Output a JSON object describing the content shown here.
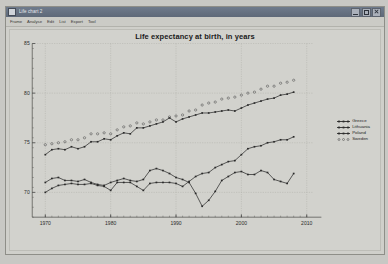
{
  "window": {
    "title": "Life chart 2",
    "icon": "app-icon",
    "buttons": [
      {
        "name": "minimize",
        "label": "_"
      },
      {
        "name": "maximize",
        "label": "□"
      },
      {
        "name": "close",
        "label": "×"
      }
    ]
  },
  "menubar": {
    "items": [
      "Frame",
      "Analyse",
      "Edit",
      "List",
      "Export",
      "Tool"
    ]
  },
  "legend": {
    "entries": [
      {
        "label": "Greece",
        "color": "#2a2a2a",
        "style": "line-marker"
      },
      {
        "label": "Lithuania",
        "color": "#2a2a2a",
        "style": "line-marker"
      },
      {
        "label": "Poland",
        "color": "#2a2a2a",
        "style": "line-marker"
      },
      {
        "label": "Sweden",
        "color": "#555555",
        "style": "dotted-marker"
      }
    ]
  },
  "chart_data": {
    "type": "line",
    "title": "Life expectancy at birth, in years",
    "xlabel": "",
    "ylabel": "",
    "xlim": [
      1968,
      2011
    ],
    "ylim": [
      67.5,
      85
    ],
    "xticks": [
      1970,
      1980,
      1990,
      2000,
      2010
    ],
    "yticks": [
      70,
      75,
      80,
      85
    ],
    "grid": true,
    "legend_position": "right",
    "x": [
      1970,
      1971,
      1972,
      1973,
      1974,
      1975,
      1976,
      1977,
      1978,
      1979,
      1980,
      1981,
      1982,
      1983,
      1984,
      1985,
      1986,
      1987,
      1988,
      1989,
      1990,
      1991,
      1992,
      1993,
      1994,
      1995,
      1996,
      1997,
      1998,
      1999,
      2000,
      2001,
      2002,
      2003,
      2004,
      2005,
      2006,
      2007,
      2008
    ],
    "series": [
      {
        "name": "Greece",
        "color": "#2a2a2a",
        "marker": "filled-square",
        "linestyle": "solid",
        "values": [
          73.8,
          74.3,
          74.4,
          74.3,
          74.6,
          74.4,
          74.6,
          75.1,
          75.1,
          75.4,
          75.3,
          75.7,
          76.0,
          75.9,
          76.5,
          76.5,
          76.7,
          76.9,
          77.1,
          77.5,
          77.1,
          77.4,
          77.6,
          77.8,
          78.0,
          78.0,
          78.1,
          78.2,
          78.3,
          78.2,
          78.5,
          78.8,
          79.0,
          79.2,
          79.4,
          79.5,
          79.8,
          79.9,
          80.1
        ]
      },
      {
        "name": "Sweden",
        "color": "#555555",
        "marker": "open-dot",
        "linestyle": "dotted",
        "values": [
          74.8,
          74.9,
          75.0,
          75.1,
          75.3,
          75.3,
          75.5,
          75.9,
          75.9,
          76.0,
          75.9,
          76.3,
          76.6,
          76.7,
          77.0,
          76.9,
          77.1,
          77.3,
          77.3,
          77.6,
          77.7,
          77.8,
          78.2,
          78.3,
          78.8,
          79.0,
          79.1,
          79.4,
          79.5,
          79.6,
          79.8,
          80.0,
          80.1,
          80.4,
          80.7,
          80.7,
          81.0,
          81.1,
          81.3
        ]
      },
      {
        "name": "Poland",
        "color": "#2a2a2a",
        "marker": "filled-square",
        "linestyle": "solid",
        "values": [
          70.0,
          70.4,
          70.7,
          70.8,
          70.9,
          70.8,
          70.8,
          70.9,
          70.7,
          70.6,
          70.2,
          71.0,
          71.0,
          71.0,
          70.6,
          70.2,
          70.9,
          71.0,
          71.0,
          71.0,
          70.9,
          70.6,
          71.1,
          71.6,
          71.9,
          72.0,
          72.5,
          72.8,
          73.1,
          73.2,
          73.8,
          74.4,
          74.6,
          74.7,
          75.0,
          75.1,
          75.3,
          75.3,
          75.6
        ]
      },
      {
        "name": "Lithuania",
        "color": "#2a2a2a",
        "marker": "filled-square",
        "linestyle": "solid",
        "values": [
          71.0,
          71.4,
          71.5,
          71.2,
          71.2,
          71.1,
          71.3,
          71.0,
          70.8,
          70.7,
          71.0,
          71.2,
          71.4,
          71.2,
          71.1,
          71.3,
          72.2,
          72.4,
          72.2,
          71.9,
          71.5,
          71.3,
          71.0,
          69.9,
          68.6,
          69.2,
          70.1,
          71.2,
          71.6,
          72.0,
          72.1,
          71.8,
          71.8,
          72.2,
          72.0,
          71.3,
          71.1,
          70.9,
          71.9
        ]
      }
    ]
  }
}
